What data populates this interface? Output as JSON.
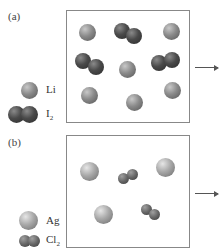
{
  "panels": [
    {
      "label": "(a)",
      "legend": [
        {
          "symbol": "Li",
          "sub": "",
          "kind": "single-atom"
        },
        {
          "symbol": "I",
          "sub": "2",
          "kind": "diatomic"
        }
      ],
      "contents": {
        "Li_atoms": 6,
        "I2_molecules": 3
      }
    },
    {
      "label": "(b)",
      "legend": [
        {
          "symbol": "Ag",
          "sub": "",
          "kind": "single-atom"
        },
        {
          "symbol": "Cl",
          "sub": "2",
          "kind": "diatomic"
        }
      ],
      "contents": {
        "Ag_atoms": 3,
        "Cl2_molecules": 2
      }
    }
  ],
  "arrow": "→",
  "colors": {
    "border": "#888888",
    "arrow": "#555555"
  }
}
